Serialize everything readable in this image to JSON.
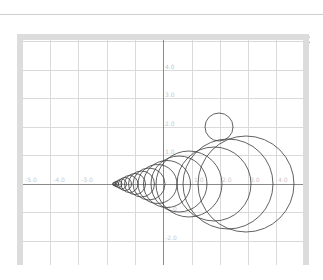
{
  "window": {
    "title": "Gealop Vis2d",
    "icon": "java-app-icon",
    "controls": {
      "minimize": "—",
      "maximize": "☐",
      "close": "✕"
    }
  },
  "plot": {
    "x_axis_labels": {
      "-5.0": "-5.0",
      "-4.0": "-4.0",
      "-3.0": "-3.0",
      "1.0": "1.0",
      "2.0": "2.0",
      "3.0": "3.0",
      "4.0": "4.0"
    },
    "y_axis_labels": {
      "4.0": "4.0",
      "3.0": "3.0",
      "2.0": "2.0",
      "1.0": "1.0",
      "-1.0": "-1.0",
      "-2.0": "-2.0"
    },
    "grid_color": "#d9d9d9",
    "axis_color": "#808080",
    "circle_color": "#333333"
  }
}
